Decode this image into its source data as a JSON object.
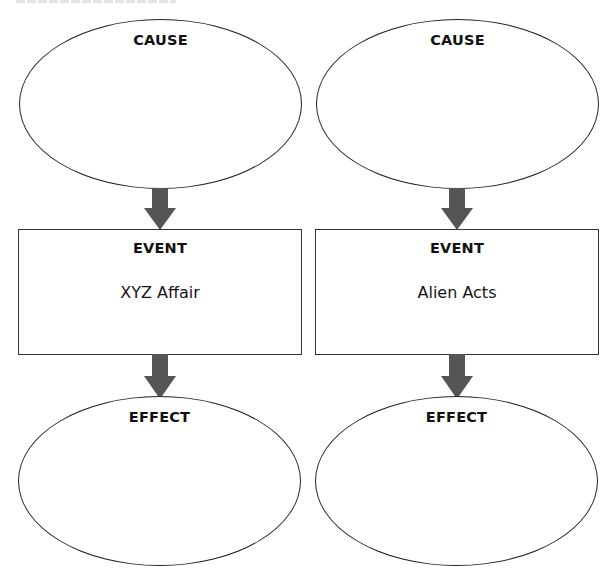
{
  "diagram": {
    "type": "cause-event-effect organizer",
    "colors": {
      "outline": "#222222",
      "arrow": "#555555",
      "background": "#ffffff"
    },
    "columns": [
      {
        "cause": {
          "heading": "CAUSE",
          "text": ""
        },
        "event": {
          "heading": "EVENT",
          "text": "XYZ Affair"
        },
        "effect": {
          "heading": "EFFECT",
          "text": ""
        }
      },
      {
        "cause": {
          "heading": "CAUSE",
          "text": ""
        },
        "event": {
          "heading": "EVENT",
          "text": "Alien Acts"
        },
        "effect": {
          "heading": "EFFECT",
          "text": ""
        }
      }
    ],
    "connections": [
      {
        "from": "cause",
        "to": "event",
        "icon": "down-arrow-icon"
      },
      {
        "from": "event",
        "to": "effect",
        "icon": "down-arrow-icon"
      }
    ]
  }
}
